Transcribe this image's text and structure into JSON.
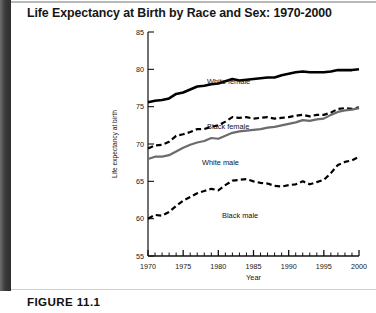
{
  "figure": {
    "title": "Life Expectancy at Birth by Race and Sex: 1970-2000",
    "caption": "FIGURE 11.1"
  },
  "chart_data": {
    "type": "line",
    "title": "Life Expectancy at Birth by Race and Sex: 1970-2000",
    "xlabel": "Year",
    "ylabel": "Life expectancy at birth",
    "xlim": [
      1970,
      2000
    ],
    "ylim": [
      55,
      85
    ],
    "ytick_labels": [
      "55",
      "60",
      "65",
      "70",
      "75",
      "80",
      "85"
    ],
    "yticks": [
      55,
      60,
      65,
      70,
      75,
      80,
      85
    ],
    "xtick_labels": [
      "1970",
      "1975",
      "1980",
      "1985",
      "1990",
      "1995",
      "2000"
    ],
    "xticks": [
      1970,
      1975,
      1980,
      1985,
      1990,
      1995,
      2000
    ],
    "minor_xtick_interval": 1,
    "grid": false,
    "legend_position": "inline-labels",
    "x": [
      1970,
      1971,
      1972,
      1973,
      1974,
      1975,
      1976,
      1977,
      1978,
      1979,
      1980,
      1981,
      1982,
      1983,
      1984,
      1985,
      1986,
      1987,
      1988,
      1989,
      1990,
      1991,
      1992,
      1993,
      1994,
      1995,
      1996,
      1997,
      1998,
      1999,
      2000
    ],
    "series": [
      {
        "name": "White female",
        "style": "solid-thick-black",
        "color": "#000000",
        "values": [
          75.6,
          75.8,
          75.9,
          76.1,
          76.7,
          76.9,
          77.3,
          77.7,
          77.8,
          78.0,
          78.1,
          78.4,
          78.7,
          78.5,
          78.6,
          78.7,
          78.8,
          78.9,
          78.9,
          79.2,
          79.4,
          79.6,
          79.7,
          79.6,
          79.6,
          79.6,
          79.7,
          79.9,
          79.9,
          79.9,
          80.0
        ]
      },
      {
        "name": "Black female",
        "style": "dashed-black",
        "color": "#000000",
        "values": [
          69.4,
          69.8,
          69.9,
          70.3,
          71.1,
          71.3,
          71.6,
          72.0,
          72.0,
          72.3,
          72.5,
          73.0,
          73.6,
          73.5,
          73.6,
          73.4,
          73.5,
          73.6,
          73.4,
          73.5,
          73.6,
          73.8,
          73.9,
          73.7,
          73.9,
          73.9,
          74.2,
          74.7,
          74.8,
          74.7,
          74.9
        ]
      },
      {
        "name": "White male",
        "style": "solid-gray",
        "color": "#6b6b6b",
        "values": [
          68.0,
          68.3,
          68.3,
          68.5,
          69.0,
          69.5,
          69.9,
          70.2,
          70.4,
          70.8,
          70.7,
          71.1,
          71.5,
          71.7,
          71.8,
          71.9,
          72.0,
          72.2,
          72.3,
          72.5,
          72.7,
          72.9,
          73.2,
          73.1,
          73.3,
          73.4,
          73.9,
          74.3,
          74.5,
          74.6,
          74.8
        ]
      },
      {
        "name": "Black male",
        "style": "dashed-black",
        "color": "#000000",
        "values": [
          60.0,
          60.5,
          60.4,
          60.9,
          61.7,
          62.4,
          62.9,
          63.4,
          63.7,
          64.0,
          63.8,
          64.5,
          65.1,
          65.2,
          65.3,
          65.0,
          64.8,
          64.7,
          64.4,
          64.3,
          64.5,
          64.6,
          65.0,
          64.6,
          64.9,
          65.2,
          66.1,
          67.2,
          67.6,
          67.8,
          68.3
        ]
      }
    ]
  },
  "plot": {
    "ylabel": "Life expectancy at birth",
    "xlabel": "Year",
    "y_ticks": [
      "85",
      "80",
      "75",
      "70",
      "65",
      "60",
      "55"
    ],
    "x_ticks": [
      "1970",
      "1975",
      "1980",
      "1985",
      "1990",
      "1995",
      "2000"
    ],
    "series_labels": {
      "white_female": "White female",
      "black_female": "Black female",
      "white_male": "White male",
      "black_male": "Black male"
    }
  }
}
